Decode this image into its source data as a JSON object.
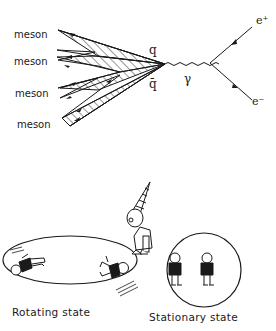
{
  "feynman_diagram": {
    "meson_labels": [
      "meson",
      "meson",
      "meson",
      "meson"
    ],
    "quark_label": "q",
    "antiquark_label": "q̄",
    "photon_label": "γ",
    "positron_label": "e⁺",
    "electron_label": "e⁻"
  },
  "cartoon": {
    "rotating_caption": "Rotating state",
    "stationary_caption": "Stationary state"
  }
}
